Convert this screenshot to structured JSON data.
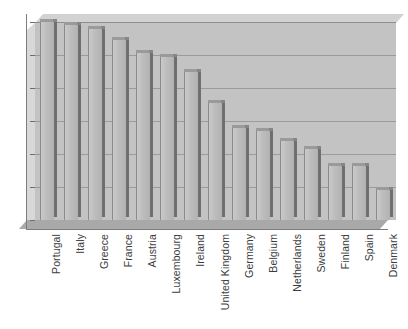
{
  "chart_data": {
    "type": "bar",
    "title": "",
    "xlabel": "",
    "ylabel": "",
    "ylim": [
      0,
      60
    ],
    "ytick_values": [
      0,
      10,
      20,
      30,
      40,
      50,
      60
    ],
    "grid": true,
    "legend": false,
    "style": "3d-bar",
    "categories": [
      "Portugal",
      "Italy",
      "Greece",
      "France",
      "Austria",
      "Luxembourg",
      "Ireland",
      "United Kingdom",
      "Germany",
      "Belgium",
      "Netherlands",
      "Sweden",
      "Finland",
      "Spain",
      "Denmark"
    ],
    "values": [
      60,
      59,
      58,
      54.5,
      50.5,
      49.5,
      45,
      35.5,
      28,
      27,
      24,
      21.5,
      16.5,
      16.5,
      9
    ]
  },
  "colors": {
    "bar_face": "#bdbdbd",
    "bar_side": "#6f6f6f",
    "bar_top": "#9a9a9a",
    "plot_background": "#c3c3c3",
    "gridline": "#9b9b9b",
    "axis": "#7d7d7d",
    "text": "#3c3c3c",
    "page_background": "#ffffff"
  }
}
